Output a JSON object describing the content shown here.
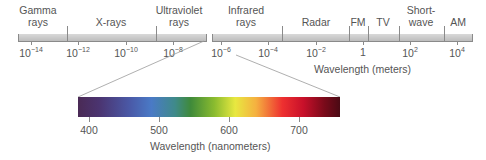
{
  "top_scale": {
    "bands": [
      {
        "name": "gamma",
        "line1": "Gamma",
        "line2": "rays",
        "x": 38
      },
      {
        "name": "xrays",
        "line1": "",
        "line2": "X-rays",
        "x": 111
      },
      {
        "name": "ultraviolet",
        "line1": "Ultraviolet",
        "line2": "rays",
        "x": 179
      },
      {
        "name": "infrared",
        "line1": "Infrared",
        "line2": "rays",
        "x": 246
      },
      {
        "name": "radar",
        "line1": "",
        "line2": "Radar",
        "x": 316
      },
      {
        "name": "fm",
        "line1": "",
        "line2": "FM",
        "x": 358
      },
      {
        "name": "tv",
        "line1": "",
        "line2": "TV",
        "x": 383
      },
      {
        "name": "shortwave",
        "line1": "Short-",
        "line2": "wave",
        "x": 421
      },
      {
        "name": "am",
        "line1": "",
        "line2": "AM",
        "x": 458
      }
    ],
    "ticks": [
      {
        "base": "10",
        "exp": "−14",
        "x": 31
      },
      {
        "base": "10",
        "exp": "−12",
        "x": 78
      },
      {
        "base": "10",
        "exp": "−10",
        "x": 126
      },
      {
        "base": "10",
        "exp": "−8",
        "x": 173
      },
      {
        "base": "10",
        "exp": "−6",
        "x": 221
      },
      {
        "base": "10",
        "exp": "−4",
        "x": 268
      },
      {
        "base": "10",
        "exp": "−2",
        "x": 316
      },
      {
        "base": "1",
        "exp": "",
        "x": 363
      },
      {
        "base": "10",
        "exp": "2",
        "x": 410
      },
      {
        "base": "10",
        "exp": "4",
        "x": 457
      }
    ],
    "axis_title": "Wavelength (meters)"
  },
  "visible_spectrum": {
    "ticks": [
      {
        "label": "400",
        "x": 89
      },
      {
        "label": "500",
        "x": 159
      },
      {
        "label": "600",
        "x": 229
      },
      {
        "label": "700",
        "x": 299
      }
    ],
    "axis_title": "Wavelength (nanometers)",
    "colors": [
      "#4a2a55",
      "#4a7ac6",
      "#3f8a3a",
      "#e8e840",
      "#ee3030",
      "#4a0a14"
    ]
  }
}
